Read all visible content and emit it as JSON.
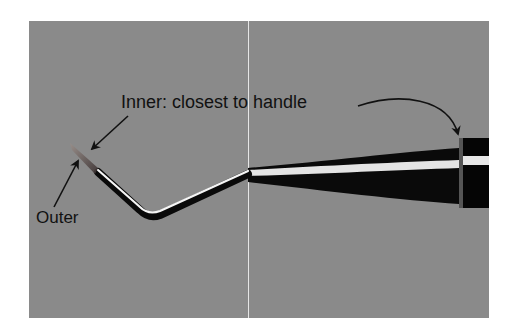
{
  "figure": {
    "background_color": "#8a8a8a",
    "divider_color": "#e6e6e6"
  },
  "labels": {
    "inner": "Inner: closest to handle",
    "outer": "Outer"
  },
  "icons": {
    "inner_arrow_tip": "arrow-icon",
    "inner_arrow_handle": "curved-arrow-icon",
    "outer_arrow": "arrow-icon"
  }
}
